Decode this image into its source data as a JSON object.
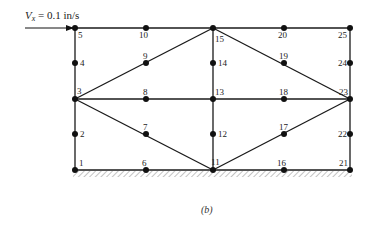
{
  "diagram": {
    "velocity_label": {
      "symbol": "V",
      "subscript": "x",
      "rest": " = 0.1 in/s"
    },
    "caption": "(b)",
    "colors": {
      "line": "#1a1a1a",
      "node": "#111111",
      "hatch": "#777777"
    },
    "nodes": [
      {
        "id": "1",
        "x": 75,
        "y": 170,
        "lx": 79,
        "ly": 166
      },
      {
        "id": "2",
        "x": 75,
        "y": 134,
        "lx": 80,
        "ly": 137
      },
      {
        "id": "3",
        "x": 75,
        "y": 99,
        "lx": 77,
        "ly": 94
      },
      {
        "id": "4",
        "x": 75,
        "y": 63,
        "lx": 80,
        "ly": 66
      },
      {
        "id": "5",
        "x": 75,
        "y": 28,
        "lx": 78,
        "ly": 38
      },
      {
        "id": "6",
        "x": 146,
        "y": 170,
        "lx": 142,
        "ly": 166
      },
      {
        "id": "7",
        "x": 146,
        "y": 134,
        "lx": 143,
        "ly": 130
      },
      {
        "id": "8",
        "x": 146,
        "y": 99,
        "lx": 143,
        "ly": 95
      },
      {
        "id": "9",
        "x": 146,
        "y": 63,
        "lx": 143,
        "ly": 59
      },
      {
        "id": "10",
        "x": 146,
        "y": 28,
        "lx": 139,
        "ly": 38
      },
      {
        "id": "11",
        "x": 213,
        "y": 170,
        "lx": 211,
        "ly": 165
      },
      {
        "id": "12",
        "x": 213,
        "y": 134,
        "lx": 218,
        "ly": 137
      },
      {
        "id": "13",
        "x": 213,
        "y": 99,
        "lx": 215,
        "ly": 95
      },
      {
        "id": "14",
        "x": 213,
        "y": 63,
        "lx": 218,
        "ly": 66
      },
      {
        "id": "15",
        "x": 213,
        "y": 28,
        "lx": 215,
        "ly": 42
      },
      {
        "id": "16",
        "x": 284,
        "y": 170,
        "lx": 277,
        "ly": 166
      },
      {
        "id": "17",
        "x": 284,
        "y": 134,
        "lx": 279,
        "ly": 130
      },
      {
        "id": "18",
        "x": 284,
        "y": 99,
        "lx": 279,
        "ly": 95
      },
      {
        "id": "19",
        "x": 284,
        "y": 63,
        "lx": 279,
        "ly": 59
      },
      {
        "id": "20",
        "x": 284,
        "y": 28,
        "lx": 278,
        "ly": 38
      },
      {
        "id": "21",
        "x": 350,
        "y": 170,
        "lx": 339,
        "ly": 166
      },
      {
        "id": "22",
        "x": 350,
        "y": 134,
        "lx": 338,
        "ly": 137
      },
      {
        "id": "23",
        "x": 350,
        "y": 99,
        "lx": 339,
        "ly": 95
      },
      {
        "id": "24",
        "x": 350,
        "y": 63,
        "lx": 338,
        "ly": 66
      },
      {
        "id": "25",
        "x": 350,
        "y": 28,
        "lx": 338,
        "ly": 38
      }
    ],
    "edges": [
      [
        "5",
        "25"
      ],
      [
        "1",
        "21"
      ],
      [
        "1",
        "5"
      ],
      [
        "21",
        "25"
      ],
      [
        "3",
        "23"
      ],
      [
        "11",
        "15"
      ],
      [
        "3",
        "15"
      ],
      [
        "3",
        "11"
      ],
      [
        "15",
        "23"
      ],
      [
        "11",
        "23"
      ]
    ]
  }
}
